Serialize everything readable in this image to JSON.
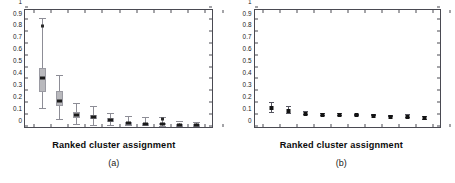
{
  "figure": {
    "background_color": "#ffffff",
    "axis_color": "#4a4a52",
    "box_fill_color": "#b9b9bd",
    "marker_color": "#121212"
  },
  "chart_data": [
    {
      "type": "box",
      "panel_id": "a",
      "title": "",
      "subcaption": "(a)",
      "xlabel": "Ranked cluster assignment",
      "ylabel": "",
      "ylim": [
        0,
        1
      ],
      "yticks": [
        0,
        0.1,
        0.2,
        0.3,
        0.4,
        0.5,
        0.6,
        0.7,
        0.8,
        0.9,
        1
      ],
      "ytick_labels": [
        "0",
        "0.1",
        "0.2",
        "0.3",
        "0.4",
        "0.5",
        "0.6",
        "0.7",
        "0.8",
        "0.9",
        "1"
      ],
      "grid": false,
      "legend": "none",
      "categories": [
        "1",
        "2",
        "3",
        "4",
        "5",
        "6",
        "7",
        "8",
        "9",
        "10"
      ],
      "boxes": [
        {
          "x": 1,
          "whisker_low": 0.155,
          "q1": 0.295,
          "median": 0.41,
          "q3": 0.495,
          "whisker_high": 0.905,
          "outliers": [
            0.845
          ]
        },
        {
          "x": 2,
          "whisker_low": 0.055,
          "q1": 0.18,
          "median": 0.22,
          "q3": 0.305,
          "whisker_high": 0.425,
          "outliers": []
        },
        {
          "x": 3,
          "whisker_low": 0.02,
          "q1": 0.075,
          "median": 0.1,
          "q3": 0.13,
          "whisker_high": 0.195,
          "outliers": []
        },
        {
          "x": 4,
          "whisker_low": 0.01,
          "q1": 0.065,
          "median": 0.085,
          "q3": 0.105,
          "whisker_high": 0.165,
          "outliers": []
        },
        {
          "x": 5,
          "whisker_low": 0.01,
          "q1": 0.045,
          "median": 0.06,
          "q3": 0.075,
          "whisker_high": 0.11,
          "outliers": []
        },
        {
          "x": 6,
          "whisker_low": 0.005,
          "q1": 0.02,
          "median": 0.03,
          "q3": 0.042,
          "whisker_high": 0.085,
          "outliers": []
        },
        {
          "x": 7,
          "whisker_low": 0.005,
          "q1": 0.018,
          "median": 0.027,
          "q3": 0.036,
          "whisker_high": 0.072,
          "outliers": []
        },
        {
          "x": 8,
          "whisker_low": 0.004,
          "q1": 0.014,
          "median": 0.022,
          "q3": 0.03,
          "whisker_high": 0.078,
          "outliers": [
            0.068
          ]
        },
        {
          "x": 9,
          "whisker_low": 0.003,
          "q1": 0.01,
          "median": 0.017,
          "q3": 0.024,
          "whisker_high": 0.038,
          "outliers": []
        },
        {
          "x": 10,
          "whisker_low": 0.002,
          "q1": 0.008,
          "median": 0.015,
          "q3": 0.021,
          "whisker_high": 0.03,
          "outliers": []
        }
      ]
    },
    {
      "type": "scatter",
      "panel_id": "b",
      "title": "",
      "subcaption": "(b)",
      "xlabel": "Ranked cluster assignment",
      "ylabel": "",
      "ylim": [
        0,
        1
      ],
      "yticks": [
        0,
        0.1,
        0.2,
        0.3,
        0.4,
        0.5,
        0.6,
        0.7,
        0.8,
        0.9,
        1
      ],
      "ytick_labels": [
        "0",
        "0.1",
        "0.2",
        "0.3",
        "0.4",
        "0.5",
        "0.6",
        "0.7",
        "0.8",
        "0.9",
        "1"
      ],
      "grid": false,
      "legend": "none",
      "categories": [
        "1",
        "2",
        "3",
        "4",
        "5",
        "6",
        "7",
        "8",
        "9",
        "10"
      ],
      "points": [
        {
          "x": 1,
          "value": 0.158,
          "err_low": 0.118,
          "err_high": 0.205
        },
        {
          "x": 2,
          "value": 0.135,
          "err_low": 0.112,
          "err_high": 0.172
        },
        {
          "x": 3,
          "value": 0.112,
          "err_low": 0.101,
          "err_high": 0.124
        },
        {
          "x": 4,
          "value": 0.102,
          "err_low": 0.096,
          "err_high": 0.109
        },
        {
          "x": 5,
          "value": 0.1,
          "err_low": 0.094,
          "err_high": 0.106
        },
        {
          "x": 6,
          "value": 0.097,
          "err_low": 0.091,
          "err_high": 0.103
        },
        {
          "x": 7,
          "value": 0.095,
          "err_low": 0.089,
          "err_high": 0.101
        },
        {
          "x": 8,
          "value": 0.086,
          "err_low": 0.08,
          "err_high": 0.092
        },
        {
          "x": 9,
          "value": 0.085,
          "err_low": 0.073,
          "err_high": 0.098
        },
        {
          "x": 10,
          "value": 0.073,
          "err_low": 0.06,
          "err_high": 0.088
        }
      ]
    }
  ]
}
